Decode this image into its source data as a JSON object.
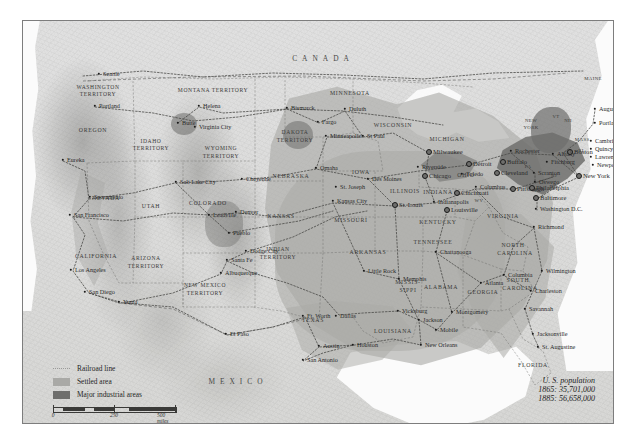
{
  "map": {
    "title": "United States Railroads, Settlement and Industry 1865-1885",
    "countries": [
      {
        "name": "CANADA",
        "x": 300,
        "y": 38
      },
      {
        "name": "MEXICO",
        "x": 215,
        "y": 361
      }
    ],
    "legend": {
      "items": [
        {
          "key": "railroad",
          "label": "Railroad line",
          "color": "#9a9a98"
        },
        {
          "key": "settled",
          "label": "Settled area",
          "color": "#a9a9a6"
        },
        {
          "key": "industrial",
          "label": "Major industrial areas",
          "color": "#6e6e6c"
        }
      ]
    },
    "scales": [
      {
        "unit": "miles",
        "ticks": [
          "0",
          "250",
          "500 miles"
        ]
      },
      {
        "unit": "kilometers",
        "ticks": [
          "0",
          "250",
          "500 kilometers"
        ]
      }
    ],
    "population": {
      "title": "U. S. population",
      "rows": [
        "1865: 35,701,000",
        "1885: 56,658,000"
      ]
    },
    "states": [
      {
        "name": "WASHINGTON",
        "x": 75,
        "y": 67,
        "cls": "terr"
      },
      {
        "name": "TERRITORY",
        "x": 75,
        "y": 74,
        "cls": "terr"
      },
      {
        "name": "OREGON",
        "x": 70,
        "y": 110,
        "cls": "state"
      },
      {
        "name": "IDAHO",
        "x": 128,
        "y": 121,
        "cls": "terr"
      },
      {
        "name": "TERRITORY",
        "x": 128,
        "y": 128,
        "cls": "terr"
      },
      {
        "name": "MONTANA TERRITORY",
        "x": 190,
        "y": 70,
        "cls": "terr"
      },
      {
        "name": "WYOMING",
        "x": 198,
        "y": 128,
        "cls": "terr"
      },
      {
        "name": "TERRITORY",
        "x": 198,
        "y": 136,
        "cls": "terr"
      },
      {
        "name": "DAKOTA",
        "x": 272,
        "y": 112,
        "cls": "terr"
      },
      {
        "name": "TERRITORY",
        "x": 272,
        "y": 120,
        "cls": "terr"
      },
      {
        "name": "MINNESOTA",
        "x": 327,
        "y": 73,
        "cls": "state"
      },
      {
        "name": "WISCONSIN",
        "x": 370,
        "y": 105,
        "cls": "state"
      },
      {
        "name": "MICHIGAN",
        "x": 424,
        "y": 119,
        "cls": "state"
      },
      {
        "name": "NEBRASKA",
        "x": 268,
        "y": 156,
        "cls": "state"
      },
      {
        "name": "IOWA",
        "x": 338,
        "y": 152,
        "cls": "state"
      },
      {
        "name": "ILLINOIS",
        "x": 382,
        "y": 171,
        "cls": "state"
      },
      {
        "name": "INDIANA",
        "x": 415,
        "y": 172,
        "cls": "state"
      },
      {
        "name": "OHIO",
        "x": 443,
        "y": 155,
        "cls": "state"
      },
      {
        "name": "NEVADA",
        "x": 83,
        "y": 178,
        "cls": "state"
      },
      {
        "name": "UTAH",
        "x": 128,
        "y": 186,
        "cls": "state"
      },
      {
        "name": "COLORADO",
        "x": 185,
        "y": 183,
        "cls": "state"
      },
      {
        "name": "KANSAS",
        "x": 258,
        "y": 196,
        "cls": "state"
      },
      {
        "name": "MISSOURI",
        "x": 328,
        "y": 200,
        "cls": "state"
      },
      {
        "name": "KENTUCKY",
        "x": 415,
        "y": 202,
        "cls": "state"
      },
      {
        "name": "VIRGINIA",
        "x": 480,
        "y": 196,
        "cls": "state"
      },
      {
        "name": "WV",
        "x": 456,
        "y": 180,
        "cls": "sm"
      },
      {
        "name": "CALIFORNIA",
        "x": 73,
        "y": 236,
        "cls": "state"
      },
      {
        "name": "ARIZONA",
        "x": 123,
        "y": 238,
        "cls": "terr"
      },
      {
        "name": "TERRITORY",
        "x": 123,
        "y": 246,
        "cls": "terr"
      },
      {
        "name": "NEW MEXICO",
        "x": 182,
        "y": 265,
        "cls": "terr"
      },
      {
        "name": "TERRITORY",
        "x": 182,
        "y": 273,
        "cls": "terr"
      },
      {
        "name": "INDIAN",
        "x": 255,
        "y": 229,
        "cls": "terr"
      },
      {
        "name": "TERRITORY",
        "x": 255,
        "y": 237,
        "cls": "terr"
      },
      {
        "name": "ARKANSAS",
        "x": 345,
        "y": 232,
        "cls": "state"
      },
      {
        "name": "TENNESSEE",
        "x": 410,
        "y": 222,
        "cls": "state"
      },
      {
        "name": "NORTH",
        "x": 490,
        "y": 225,
        "cls": "state"
      },
      {
        "name": "CAROLINA",
        "x": 492,
        "y": 233,
        "cls": "state"
      },
      {
        "name": "SOUTH",
        "x": 495,
        "y": 260,
        "cls": "state"
      },
      {
        "name": "CAROLINA",
        "x": 497,
        "y": 268,
        "cls": "state"
      },
      {
        "name": "MISSIS-",
        "x": 385,
        "y": 262,
        "cls": "state"
      },
      {
        "name": "SIPPI",
        "x": 385,
        "y": 270,
        "cls": "state"
      },
      {
        "name": "ALABAMA",
        "x": 418,
        "y": 267,
        "cls": "state"
      },
      {
        "name": "GEORGIA",
        "x": 460,
        "y": 272,
        "cls": "state"
      },
      {
        "name": "TEXAS",
        "x": 290,
        "y": 300,
        "cls": "state"
      },
      {
        "name": "LOUISIANA",
        "x": 370,
        "y": 311,
        "cls": "state"
      },
      {
        "name": "FLORIDA",
        "x": 510,
        "y": 345,
        "cls": "state"
      },
      {
        "name": "NEW",
        "x": 508,
        "y": 100,
        "cls": "sm"
      },
      {
        "name": "YORK",
        "x": 508,
        "y": 107,
        "cls": "sm"
      },
      {
        "name": "PA",
        "x": 505,
        "y": 146,
        "cls": "sm"
      },
      {
        "name": "MAINE",
        "x": 570,
        "y": 58,
        "cls": "sm"
      },
      {
        "name": "VT",
        "x": 533,
        "y": 96,
        "cls": "sm"
      },
      {
        "name": "NH",
        "x": 545,
        "y": 100,
        "cls": "sm"
      },
      {
        "name": "MASS.",
        "x": 560,
        "y": 119,
        "cls": "sm"
      },
      {
        "name": "RI",
        "x": 558,
        "y": 130,
        "cls": "sm"
      },
      {
        "name": "CT",
        "x": 546,
        "y": 131,
        "cls": "sm"
      },
      {
        "name": "NJ",
        "x": 531,
        "y": 155,
        "cls": "sm"
      },
      {
        "name": "MD",
        "x": 513,
        "y": 170,
        "cls": "sm"
      },
      {
        "name": "DE",
        "x": 530,
        "y": 166,
        "cls": "sm"
      }
    ],
    "cities": [
      {
        "name": "Seattle",
        "x": 76,
        "y": 53,
        "a": "r",
        "big": false
      },
      {
        "name": "Portland",
        "x": 72,
        "y": 85,
        "a": "r",
        "big": false
      },
      {
        "name": "Eureka",
        "x": 40,
        "y": 139,
        "a": "r",
        "big": false
      },
      {
        "name": "Sacramento",
        "x": 67,
        "y": 176,
        "a": "r",
        "big": false
      },
      {
        "name": "San Francisco",
        "x": 47,
        "y": 194,
        "a": "r",
        "big": false
      },
      {
        "name": "Los Angeles",
        "x": 48,
        "y": 249,
        "a": "r",
        "big": false
      },
      {
        "name": "San Diego",
        "x": 62,
        "y": 271,
        "a": "r",
        "big": false
      },
      {
        "name": "Yuma",
        "x": 96,
        "y": 281,
        "a": "r",
        "big": false
      },
      {
        "name": "Butte",
        "x": 155,
        "y": 102,
        "a": "r",
        "big": false
      },
      {
        "name": "Virginia City",
        "x": 172,
        "y": 106,
        "a": "r",
        "big": false
      },
      {
        "name": "Helena",
        "x": 176,
        "y": 85,
        "a": "r",
        "big": false
      },
      {
        "name": "Bismarck",
        "x": 264,
        "y": 87,
        "a": "r",
        "big": false
      },
      {
        "name": "Fargo",
        "x": 295,
        "y": 101,
        "a": "r",
        "big": false
      },
      {
        "name": "Duluth",
        "x": 322,
        "y": 88,
        "a": "r",
        "big": false
      },
      {
        "name": "Minneapolis",
        "x": 303,
        "y": 115,
        "a": "r",
        "big": false
      },
      {
        "name": "St Paul",
        "x": 340,
        "y": 115,
        "a": "r",
        "big": false
      },
      {
        "name": "Milwaukee",
        "x": 406,
        "y": 131,
        "a": "r",
        "big": true
      },
      {
        "name": "Riverside",
        "x": 395,
        "y": 146,
        "a": "r",
        "big": false
      },
      {
        "name": "Chicago",
        "x": 402,
        "y": 155,
        "a": "r",
        "big": true
      },
      {
        "name": "Omaha",
        "x": 293,
        "y": 147,
        "a": "r",
        "big": false
      },
      {
        "name": "Des Moines",
        "x": 345,
        "y": 158,
        "a": "r",
        "big": false
      },
      {
        "name": "Salt Lake City",
        "x": 153,
        "y": 161,
        "a": "r",
        "big": false
      },
      {
        "name": "Cheyenne",
        "x": 219,
        "y": 158,
        "a": "r",
        "big": false
      },
      {
        "name": "Leadville",
        "x": 186,
        "y": 194,
        "a": "r",
        "big": false
      },
      {
        "name": "Denver",
        "x": 213,
        "y": 191,
        "a": "r",
        "big": false
      },
      {
        "name": "Pueblo",
        "x": 206,
        "y": 212,
        "a": "r",
        "big": false
      },
      {
        "name": "Dodge City",
        "x": 223,
        "y": 230,
        "a": "r",
        "big": false
      },
      {
        "name": "Santa Fe",
        "x": 204,
        "y": 239,
        "a": "r",
        "big": false
      },
      {
        "name": "Albuquerque",
        "x": 198,
        "y": 252,
        "a": "r",
        "big": false
      },
      {
        "name": "El Paso",
        "x": 203,
        "y": 313,
        "a": "r",
        "big": false
      },
      {
        "name": "Kansas City",
        "x": 310,
        "y": 180,
        "a": "r",
        "big": false
      },
      {
        "name": "St. Joseph",
        "x": 313,
        "y": 166,
        "a": "r",
        "big": false
      },
      {
        "name": "St. Louis",
        "x": 372,
        "y": 184,
        "a": "r",
        "big": true
      },
      {
        "name": "Indianapolis",
        "x": 411,
        "y": 181,
        "a": "r",
        "big": false
      },
      {
        "name": "Louisville",
        "x": 424,
        "y": 189,
        "a": "r",
        "big": true
      },
      {
        "name": "Cincinnati",
        "x": 434,
        "y": 172,
        "a": "r",
        "big": true
      },
      {
        "name": "Columbus",
        "x": 453,
        "y": 166,
        "a": "r",
        "big": false
      },
      {
        "name": "Toledo",
        "x": 439,
        "y": 153,
        "a": "r",
        "big": false
      },
      {
        "name": "Detroit",
        "x": 446,
        "y": 143,
        "a": "r",
        "big": true
      },
      {
        "name": "Cleveland",
        "x": 474,
        "y": 152,
        "a": "r",
        "big": true
      },
      {
        "name": "Pittsburgh",
        "x": 490,
        "y": 168,
        "a": "r",
        "big": true
      },
      {
        "name": "Buffalo",
        "x": 480,
        "y": 141,
        "a": "r",
        "big": true
      },
      {
        "name": "Rochester",
        "x": 488,
        "y": 130,
        "a": "r",
        "big": false
      },
      {
        "name": "Albany",
        "x": 530,
        "y": 133,
        "a": "r",
        "big": false
      },
      {
        "name": "Fitchburg",
        "x": 524,
        "y": 141,
        "a": "r",
        "big": false
      },
      {
        "name": "Scranton",
        "x": 511,
        "y": 152,
        "a": "r",
        "big": false
      },
      {
        "name": "Oswego",
        "x": 512,
        "y": 161,
        "a": "r",
        "big": false
      },
      {
        "name": "Philadelphia",
        "x": 509,
        "y": 167,
        "a": "r",
        "big": true
      },
      {
        "name": "Baltimore",
        "x": 513,
        "y": 177,
        "a": "r",
        "big": true
      },
      {
        "name": "Washington D.C.",
        "x": 513,
        "y": 188,
        "a": "r",
        "big": false
      },
      {
        "name": "New York",
        "x": 556,
        "y": 155,
        "a": "r",
        "big": true
      },
      {
        "name": "Boston",
        "x": 547,
        "y": 131,
        "a": "r",
        "big": true
      },
      {
        "name": "Cambridge",
        "x": 568,
        "y": 120,
        "a": "r",
        "big": false
      },
      {
        "name": "Quincy",
        "x": 568,
        "y": 128,
        "a": "r",
        "big": false
      },
      {
        "name": "Lawrence",
        "x": 568,
        "y": 136,
        "a": "r",
        "big": false
      },
      {
        "name": "Newport",
        "x": 570,
        "y": 144,
        "a": "r",
        "big": false
      },
      {
        "name": "Portland",
        "x": 572,
        "y": 102,
        "a": "r",
        "big": false
      },
      {
        "name": "Augusta",
        "x": 572,
        "y": 88,
        "a": "r",
        "big": false
      },
      {
        "name": "Richmond",
        "x": 511,
        "y": 206,
        "a": "r",
        "big": false
      },
      {
        "name": "Chattanooga",
        "x": 413,
        "y": 231,
        "a": "r",
        "big": false
      },
      {
        "name": "Wilmington",
        "x": 519,
        "y": 250,
        "a": "r",
        "big": false
      },
      {
        "name": "Columbia",
        "x": 481,
        "y": 254,
        "a": "r",
        "big": false
      },
      {
        "name": "Charleston",
        "x": 508,
        "y": 270,
        "a": "r",
        "big": false
      },
      {
        "name": "Atlanta",
        "x": 458,
        "y": 262,
        "a": "r",
        "big": false
      },
      {
        "name": "Savannah",
        "x": 502,
        "y": 288,
        "a": "r",
        "big": false
      },
      {
        "name": "Jacksonville",
        "x": 510,
        "y": 313,
        "a": "r",
        "big": false
      },
      {
        "name": "St. Augustine",
        "x": 515,
        "y": 326,
        "a": "r",
        "big": false
      },
      {
        "name": "Montgomery",
        "x": 429,
        "y": 291,
        "a": "r",
        "big": false
      },
      {
        "name": "Mobile",
        "x": 413,
        "y": 309,
        "a": "r",
        "big": false
      },
      {
        "name": "Jackson",
        "x": 396,
        "y": 299,
        "a": "r",
        "big": false
      },
      {
        "name": "Vicksburg",
        "x": 375,
        "y": 290,
        "a": "r",
        "big": false
      },
      {
        "name": "New Orleans",
        "x": 398,
        "y": 324,
        "a": "r",
        "big": false
      },
      {
        "name": "Memphis",
        "x": 376,
        "y": 258,
        "a": "r",
        "big": false
      },
      {
        "name": "Little Rock",
        "x": 341,
        "y": 250,
        "a": "r",
        "big": false
      },
      {
        "name": "Ft. Worth",
        "x": 280,
        "y": 295,
        "a": "r",
        "big": false
      },
      {
        "name": "Dallas",
        "x": 313,
        "y": 295,
        "a": "r",
        "big": false
      },
      {
        "name": "Austin",
        "x": 296,
        "y": 325,
        "a": "r",
        "big": false
      },
      {
        "name": "Houston",
        "x": 330,
        "y": 324,
        "a": "r",
        "big": false
      },
      {
        "name": "San Antonio",
        "x": 280,
        "y": 339,
        "a": "r",
        "big": false
      }
    ]
  }
}
